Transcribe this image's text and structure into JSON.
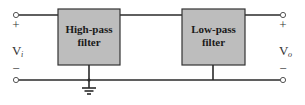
{
  "diagram": {
    "title": "",
    "blocks": [
      {
        "id": "hp",
        "label_line1": "High-pass",
        "label_line2": "filter"
      },
      {
        "id": "lp",
        "label_line1": "Low-pass",
        "label_line2": "filter"
      }
    ],
    "input": {
      "plus": "+",
      "minus": "−",
      "symbol": "V",
      "subscript": "i"
    },
    "output": {
      "plus": "+",
      "minus": "−",
      "symbol": "V",
      "subscript": "o"
    },
    "colors": {
      "box_fill": "#bdbdbd",
      "wire": "#2a2a2a",
      "terminal": "#555555"
    }
  }
}
